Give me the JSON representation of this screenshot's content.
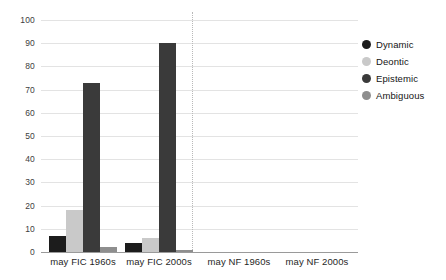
{
  "chart_data": {
    "type": "bar",
    "title": "",
    "subtitle": "",
    "xlabel": "",
    "ylabel": "",
    "ylim": [
      0,
      100
    ],
    "ytick_step": 10,
    "yticks": [
      "100",
      "90",
      "80",
      "70",
      "60",
      "50",
      "40",
      "30",
      "20",
      "10",
      "0"
    ],
    "grid": true,
    "legend_position": "right",
    "categories": [
      "may FIC 1960s",
      "may FIC 2000s",
      "may NF 1960s",
      "may NF 2000s"
    ],
    "series": [
      {
        "name": "Dynamic",
        "color": "#1c1c1c",
        "values": [
          6,
          7,
          17,
          4
        ]
      },
      {
        "name": "Deontic",
        "color": "#c9c9c9",
        "values": [
          11,
          18,
          15,
          6
        ]
      },
      {
        "name": "Epistemic",
        "color": "#3a3a3a",
        "values": [
          83,
          73,
          65,
          90
        ]
      },
      {
        "name": "Ambiguous",
        "color": "#8e8e8e",
        "values": [
          0,
          2,
          4,
          1
        ]
      }
    ],
    "annotations": {
      "divider": "dotted vertical separator between FIC and NF groups"
    }
  },
  "legend": {
    "items": [
      {
        "label": "Dynamic"
      },
      {
        "label": "Deontic"
      },
      {
        "label": "Epistemic"
      },
      {
        "label": "Ambiguous"
      }
    ]
  },
  "axis": {
    "y": {
      "t100": "100",
      "t90": "90",
      "t80": "80",
      "t70": "70",
      "t60": "60",
      "t50": "50",
      "t40": "40",
      "t30": "30",
      "t20": "20",
      "t10": "10",
      "t0": "0"
    },
    "x": {
      "g0": "may FIC 1960s",
      "g1": "may FIC 2000s",
      "g2": "may NF 1960s",
      "g3": "may NF 2000s"
    }
  }
}
